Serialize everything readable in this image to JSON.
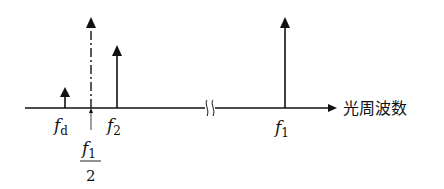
{
  "diagram": {
    "axis_label": "光周波数",
    "colors": {
      "ink": "#111111",
      "background": "#ffffff"
    },
    "components": [
      {
        "id": "fd",
        "label": "f",
        "subscript": "d",
        "x": 65,
        "top": 88,
        "style": "solid"
      },
      {
        "id": "f1_half",
        "label": "f",
        "subscript": "1",
        "denominator": "2",
        "x": 91,
        "top": 17,
        "style": "dash-dot"
      },
      {
        "id": "f2",
        "label": "f",
        "subscript": "2",
        "x": 117,
        "top": 45,
        "style": "solid"
      },
      {
        "id": "f1",
        "label": "f",
        "subscript": "1",
        "x": 285,
        "top": 17,
        "style": "solid"
      }
    ],
    "axis": {
      "y": 108,
      "x_start": 25,
      "x_end": 337,
      "break_x": 210
    }
  },
  "labels": {
    "fd_main": "f",
    "fd_sub": "d",
    "f2_main": "f",
    "f2_sub": "2",
    "f1_main": "f",
    "f1_sub": "1",
    "half_num_main": "f",
    "half_num_sub": "1",
    "half_den": "2"
  }
}
